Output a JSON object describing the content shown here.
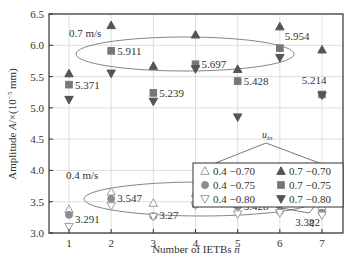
{
  "chart_data": {
    "type": "scatter",
    "title": "",
    "xlabel": "Number of IETBs n",
    "ylabel": "Amplitude A/×(10⁻⁵ mm)",
    "xlim": [
      0.5,
      7.5
    ],
    "ylim": [
      3.0,
      6.5
    ],
    "x": [
      1,
      2,
      3,
      4,
      5,
      6,
      7
    ],
    "x_ticks": [
      "1",
      "2",
      "3",
      "4",
      "5",
      "6",
      "7"
    ],
    "y_ticks": [
      "3.0",
      "3.5",
      "4.0",
      "4.5",
      "5.0",
      "5.5",
      "6.0",
      "6.5"
    ],
    "grid": true,
    "legend_title": "u_in",
    "legend_position": "center-right",
    "series": [
      {
        "name": "0.4 −0.70",
        "marker": "triangle-up-open",
        "color": "#9a9a9a",
        "values": [
          3.38,
          3.66,
          3.48,
          3.64,
          3.46,
          3.63,
          3.42
        ]
      },
      {
        "name": "0.4 −0.75",
        "marker": "circle",
        "color": "#8c8c8c",
        "values": [
          3.291,
          3.547,
          3.27,
          3.457,
          3.428,
          3.347,
          3.322
        ]
      },
      {
        "name": "0.4 −0.80",
        "marker": "triangle-down-open",
        "color": "#9a9a9a",
        "values": [
          3.1,
          3.43,
          3.26,
          3.44,
          3.3,
          3.32,
          3.28
        ]
      },
      {
        "name": "0.7 −0.70",
        "marker": "triangle-up",
        "color": "#555555",
        "values": [
          5.55,
          6.32,
          5.67,
          6.17,
          5.62,
          6.3,
          5.93
        ]
      },
      {
        "name": "0.7 −0.75",
        "marker": "square",
        "color": "#777777",
        "values": [
          5.371,
          5.911,
          5.239,
          5.697,
          5.428,
          5.954,
          5.214
        ]
      },
      {
        "name": "0.7 −0.80",
        "marker": "triangle-down",
        "color": "#555555",
        "values": [
          5.13,
          5.55,
          5.1,
          5.62,
          4.85,
          5.8,
          5.2
        ]
      }
    ],
    "annotations": {
      "group_high_label": "0.7 m/s",
      "group_low_label": "0.4 m/s",
      "eta_label": "η",
      "value_labels_high": [
        "5.371",
        "5.911",
        "5.239",
        "5.697",
        "5.428",
        "5.954",
        "5.214"
      ],
      "value_labels_low": [
        "3.291",
        "3.547",
        "3.27",
        "3.457",
        "3.428",
        "3.347",
        "3.322"
      ]
    }
  }
}
